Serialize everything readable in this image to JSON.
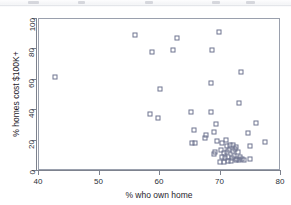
{
  "chart_data": {
    "type": "scatter",
    "title": "",
    "xlabel": "% who own home",
    "ylabel": "% homes cost $100K+",
    "xlim": [
      40,
      80
    ],
    "ylim": [
      0,
      100
    ],
    "xticks": [
      40,
      50,
      60,
      70,
      80
    ],
    "yticks": [
      0,
      20,
      40,
      60,
      80,
      100
    ],
    "grid": false,
    "legend": null,
    "marker": {
      "shape": "open-square",
      "edge_color": "#6f7590",
      "fill": "none",
      "size_px": 5
    },
    "series": [
      {
        "name": "states",
        "points": [
          [
            42.6,
            62.0
          ],
          [
            55.9,
            89.2
          ],
          [
            58.6,
            78.6
          ],
          [
            62.1,
            79.8
          ],
          [
            62.8,
            87.3
          ],
          [
            69.8,
            91.2
          ],
          [
            68.6,
            79.3
          ],
          [
            73.4,
            65.3
          ],
          [
            68.4,
            58.0
          ],
          [
            60.0,
            54.2
          ],
          [
            73.0,
            44.8
          ],
          [
            58.3,
            37.2
          ],
          [
            59.6,
            34.7
          ],
          [
            65.2,
            38.9
          ],
          [
            68.4,
            38.9
          ],
          [
            75.8,
            31.7
          ],
          [
            69.3,
            30.9
          ],
          [
            65.6,
            27.1
          ],
          [
            68.9,
            25.8
          ],
          [
            74.6,
            25.3
          ],
          [
            67.6,
            23.4
          ],
          [
            67.5,
            21.6
          ],
          [
            77.4,
            19.2
          ],
          [
            65.3,
            18.2
          ],
          [
            65.8,
            18.7
          ],
          [
            69.5,
            19.9
          ],
          [
            70.3,
            18.3
          ],
          [
            71.0,
            16.5
          ],
          [
            71.6,
            16.8
          ],
          [
            72.1,
            17.0
          ],
          [
            72.6,
            15.6
          ],
          [
            74.8,
            16.3
          ],
          [
            69.1,
            12.3
          ],
          [
            69.0,
            11.1
          ],
          [
            70.0,
            13.5
          ],
          [
            70.6,
            12.0
          ],
          [
            71.1,
            12.5
          ],
          [
            71.4,
            13.8
          ],
          [
            72.0,
            13.0
          ],
          [
            72.4,
            14.2
          ],
          [
            72.9,
            12.8
          ],
          [
            70.2,
            9.0
          ],
          [
            70.8,
            8.4
          ],
          [
            71.3,
            9.4
          ],
          [
            71.9,
            8.8
          ],
          [
            72.3,
            9.6
          ],
          [
            72.8,
            8.2
          ],
          [
            73.2,
            9.1
          ],
          [
            69.9,
            5.7
          ],
          [
            70.5,
            6.1
          ],
          [
            71.2,
            6.6
          ],
          [
            71.8,
            6.3
          ],
          [
            72.5,
            7.2
          ],
          [
            73.1,
            7.5
          ],
          [
            73.6,
            7.8
          ],
          [
            74.9,
            7.6
          ],
          [
            73.9,
            7.1
          ],
          [
            70.9,
            20.1
          ]
        ]
      }
    ]
  }
}
